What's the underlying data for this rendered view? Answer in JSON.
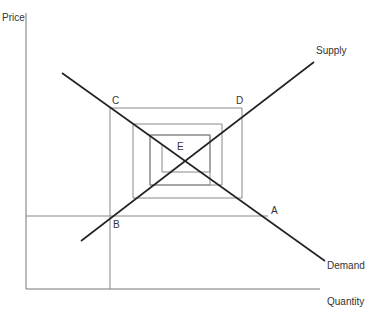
{
  "diagram": {
    "type": "cobweb model (supply and demand)",
    "axes": {
      "y_label": "Price",
      "x_label": "Quantity"
    },
    "curves": {
      "supply_label": "Supply",
      "demand_label": "Demand"
    },
    "points": {
      "A": "A",
      "B": "B",
      "C": "C",
      "D": "D",
      "E": "E"
    },
    "colors": {
      "curve": "#222222",
      "axis": "#666666",
      "grid": "#888888",
      "text": "#333333"
    }
  }
}
